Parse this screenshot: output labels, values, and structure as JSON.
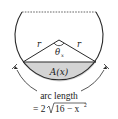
{
  "diagram": {
    "labels": {
      "radius_left": "r",
      "radius_right": "r",
      "angle": "θ",
      "angle_subscript": "x",
      "area": "A(x)",
      "arc_caption_line1": "arc length",
      "arc_caption_line2_prefix": "= 2",
      "arc_caption_line2_radicand": "16 − x",
      "arc_caption_line2_exponent": "2"
    },
    "colors": {
      "stroke": "#2a2a2a",
      "shaded_segment": "#d4d4d4",
      "dashed_chord": "#555555",
      "background": "#ffffff"
    }
  }
}
